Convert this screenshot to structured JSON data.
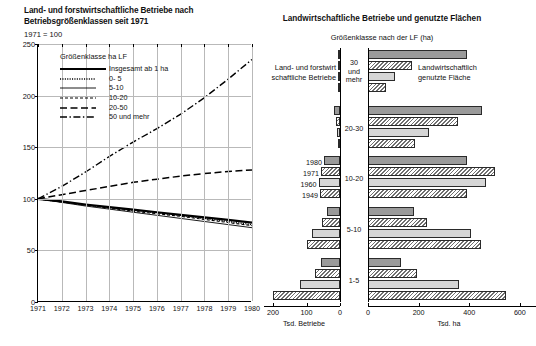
{
  "left": {
    "title": "Land- und forstwirtschaftliche Betriebe nach Betriebsgrößenklassen seit 1971",
    "index_note": "1971 = 100",
    "legend_title": "Größenklasse ha LF",
    "legend": [
      {
        "label": "Insgesamt ab 1 ha",
        "style": "thick-solid"
      },
      {
        "label": "0- 5",
        "style": "dotted"
      },
      {
        "label": "5-10",
        "style": "thin-solid"
      },
      {
        "label": "10-20",
        "style": "short-dash"
      },
      {
        "label": "20-50",
        "style": "long-dash"
      },
      {
        "label": "50 und mehr",
        "style": "dash-dot"
      }
    ]
  },
  "right": {
    "title": "Landwirtschaftliche Betriebe und genutzte Flächen",
    "subtitle": "Größenklasse nach der LF (ha)",
    "left_side_label": "Land- und forstwirt schaftliche Betriebe",
    "right_side_label": "Landwirtschaftlich genutzte Fläche",
    "year_labels": [
      "1980",
      "1971",
      "1960",
      "1949"
    ]
  },
  "chart_data": [
    {
      "type": "line",
      "title": "Land- und forstwirtschaftliche Betriebe nach Betriebsgrößenklassen seit 1971",
      "subtitle": "1971 = 100",
      "xlabel": "",
      "ylabel": "",
      "xlim": [
        1971,
        1980
      ],
      "ylim": [
        0,
        250
      ],
      "yticks": [
        0,
        50,
        100,
        150,
        200,
        250
      ],
      "xticks": [
        1971,
        1972,
        1973,
        1974,
        1975,
        1976,
        1977,
        1978,
        1979,
        1980
      ],
      "grid": true,
      "legend_position": "inside-top-left",
      "x": [
        1971,
        1972,
        1973,
        1974,
        1975,
        1976,
        1977,
        1978,
        1979,
        1980
      ],
      "series": [
        {
          "name": "Insgesamt ab 1 ha",
          "style": "thick-solid",
          "values": [
            100,
            97.5,
            94.5,
            92,
            89.5,
            87,
            84.5,
            82,
            79.5,
            77
          ]
        },
        {
          "name": "0- 5",
          "style": "dotted",
          "values": [
            100,
            97,
            94,
            91.5,
            89,
            86.5,
            84,
            81,
            78,
            75
          ]
        },
        {
          "name": "5-10",
          "style": "thin-solid",
          "values": [
            100,
            96.5,
            93,
            90,
            87,
            84,
            81,
            78,
            75,
            72
          ]
        },
        {
          "name": "10-20",
          "style": "short-dash",
          "values": [
            100,
            97,
            94,
            91,
            88,
            85.5,
            83,
            80,
            77,
            74
          ]
        },
        {
          "name": "20-50",
          "style": "long-dash",
          "values": [
            100,
            104,
            108,
            112,
            116,
            119,
            122,
            124.5,
            126.5,
            128
          ]
        },
        {
          "name": "50 und mehr",
          "style": "dash-dot",
          "values": [
            100,
            112,
            126,
            141,
            155,
            168,
            182,
            198,
            216,
            235
          ]
        }
      ]
    },
    {
      "type": "bar",
      "orientation": "pyramid-horizontal",
      "title": "Landwirtschaftliche Betriebe und genutzte Flächen",
      "subtitle": "Größenklasse nach der LF (ha)",
      "categories": [
        "30 und mehr",
        "20-30",
        "10-20",
        "5-10",
        "1-5"
      ],
      "years": [
        "1980",
        "1971",
        "1960",
        "1949"
      ],
      "left": {
        "name": "Land- und forstwirtschaftliche Betriebe",
        "unit": "Tsd. Betriebe",
        "axis_label": "Tsd. Betriebe",
        "xlim": [
          0,
          215
        ],
        "xticks": [
          200,
          100,
          0
        ],
        "direction": "right-to-left",
        "values": {
          "30 und mehr": [
            5,
            3,
            2,
            1
          ],
          "20-30": [
            19,
            13,
            9,
            7
          ],
          "10-20": [
            48,
            57,
            64,
            60
          ],
          "5-10": [
            38,
            55,
            85,
            100
          ],
          "1-5": [
            56,
            75,
            120,
            200
          ]
        }
      },
      "right": {
        "name": "Landwirtschaftlich genutzte Fläche",
        "unit": "Tsd. ha",
        "axis_label": "Tsd. ha",
        "xlim": [
          0,
          640
        ],
        "xticks": [
          0,
          200,
          400,
          600
        ],
        "direction": "left-to-right",
        "values": {
          "30 und mehr": [
            390,
            175,
            105,
            70
          ],
          "20-30": [
            450,
            355,
            240,
            185
          ],
          "10-20": [
            390,
            500,
            465,
            390
          ],
          "5-10": [
            180,
            235,
            405,
            445
          ],
          "1-5": [
            130,
            195,
            360,
            545
          ]
        }
      }
    }
  ]
}
